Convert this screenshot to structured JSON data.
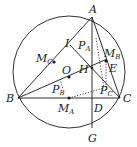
{
  "diagram": {
    "type": "geometry",
    "colors": {
      "stroke": "#1a1a1a",
      "background": "#ffffff"
    },
    "circle": {
      "cx": 69,
      "cy": 72,
      "r": 56
    },
    "points": {
      "A": {
        "x": 92,
        "y": 17
      },
      "B": {
        "x": 18,
        "y": 98
      },
      "C": {
        "x": 120,
        "y": 98
      },
      "D": {
        "x": 92,
        "y": 98
      },
      "G": {
        "x": 92,
        "y": 128
      },
      "H": {
        "x": 92,
        "y": 68
      },
      "E": {
        "x": 106,
        "y": 61
      },
      "I": {
        "x": 70,
        "y": 45
      },
      "MC": {
        "x": 54,
        "y": 62
      },
      "MB": {
        "x": 106,
        "y": 61
      },
      "MA": {
        "x": 69,
        "y": 98
      },
      "O": {
        "x": 69,
        "y": 77
      },
      "PA": {
        "x": 93,
        "y": 36
      },
      "PB": {
        "x": 62,
        "y": 87
      },
      "PC": {
        "x": 102,
        "y": 88
      }
    },
    "labels": {
      "A": "A",
      "B": "B",
      "C": "C",
      "D": "D",
      "E": "E",
      "G": "G",
      "H": "H",
      "I": "I",
      "O": "O",
      "M": "M",
      "P": "P",
      "sub_A": "A",
      "sub_B": "B",
      "sub_C": "C"
    }
  }
}
